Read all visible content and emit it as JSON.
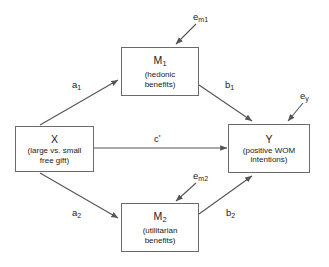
{
  "diagram": {
    "type": "parallel-multiple-mediator-path-model",
    "background_color": "#ffffff",
    "stroke_color": "#555555",
    "box_border_color": "#6b6b6b",
    "text_color": "#1a1a1a",
    "nodes": [
      {
        "id": "x",
        "symbol": "X",
        "description": "(large vs. small free gift)",
        "desc_line_1": "(large vs. small",
        "desc_line_2": "free gift)",
        "role": "independent-variable"
      },
      {
        "id": "m1",
        "symbol": "M",
        "subscript": "1",
        "description": "(hedonic benefits)",
        "desc_line_1": "(hedonic",
        "desc_line_2": "benefits)",
        "role": "mediator"
      },
      {
        "id": "m2",
        "symbol": "M",
        "subscript": "2",
        "description": "(utilitarian benefits)",
        "desc_line_1": "(utilitarian",
        "desc_line_2": "benefits)",
        "role": "mediator"
      },
      {
        "id": "y",
        "symbol": "Y",
        "description": "(positive WOM intentions)",
        "desc_line_1": "(positive WOM",
        "desc_line_2": "intentions)",
        "role": "dependent-variable"
      }
    ],
    "paths": [
      {
        "id": "a1",
        "label": "a",
        "subscript": "1",
        "from": "x",
        "to": "m1"
      },
      {
        "id": "a2",
        "label": "a",
        "subscript": "2",
        "from": "x",
        "to": "m2"
      },
      {
        "id": "b1",
        "label": "b",
        "subscript": "1",
        "from": "m1",
        "to": "y"
      },
      {
        "id": "b2",
        "label": "b",
        "subscript": "2",
        "from": "m2",
        "to": "y"
      },
      {
        "id": "cprime",
        "label": "c",
        "prime": "'",
        "from": "x",
        "to": "y"
      }
    ],
    "error_terms": [
      {
        "id": "em1",
        "label": "e",
        "subscript": "m1",
        "target": "m1"
      },
      {
        "id": "em2",
        "label": "e",
        "subscript": "m2",
        "target": "m2"
      },
      {
        "id": "ey",
        "label": "e",
        "subscript": "y",
        "target": "y"
      }
    ]
  }
}
